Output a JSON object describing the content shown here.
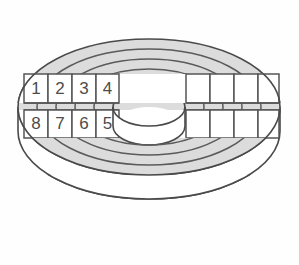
{
  "figure": {
    "kind": "disk-platter-diagram",
    "title": "",
    "background_color": "#fefefe",
    "platter_fill": "#dcdcdc",
    "hole_fill": "#ffffff",
    "line_color": "#4a4a4a",
    "label_color": "#4c4c4c",
    "sector_band_fill": "#ffffff"
  },
  "geometry": {
    "center_x": 149,
    "center_y": 107,
    "edge_offset_y": 62,
    "rings": [
      {
        "name": "platter-outer-edge",
        "rx": 131,
        "ry": 68
      },
      {
        "name": "track-1",
        "rx": 112,
        "ry": 58
      },
      {
        "name": "track-2",
        "rx": 93,
        "ry": 48
      },
      {
        "name": "track-3",
        "rx": 74,
        "ry": 38
      },
      {
        "name": "track-4",
        "rx": 55,
        "ry": 28
      },
      {
        "name": "spindle-hole",
        "rx": 36,
        "ry": 19
      }
    ],
    "bands": [
      {
        "name": "upper-sector-band",
        "y_top": 74,
        "y_bottom": 103
      },
      {
        "name": "lower-sector-band",
        "y_top": 110,
        "y_bottom": 138
      }
    ],
    "left_cell_edges": [
      24,
      48,
      72,
      96,
      119
    ],
    "right_cell_edges": [
      186,
      210,
      234,
      258,
      279
    ]
  },
  "sectors": {
    "upper_row": [
      {
        "id": "sector-1",
        "label": "1",
        "x_center": 36
      },
      {
        "id": "sector-2",
        "label": "2",
        "x_center": 60
      },
      {
        "id": "sector-3",
        "label": "3",
        "x_center": 84
      },
      {
        "id": "sector-4",
        "label": "4",
        "x_center": 107
      }
    ],
    "upper_row_right": [
      {
        "id": "sector-upper-r1",
        "label": "",
        "x_center": 198
      },
      {
        "id": "sector-upper-r2",
        "label": "",
        "x_center": 222
      },
      {
        "id": "sector-upper-r3",
        "label": "",
        "x_center": 246
      },
      {
        "id": "sector-upper-r4",
        "label": "",
        "x_center": 268
      }
    ],
    "lower_row": [
      {
        "id": "sector-8",
        "label": "8",
        "x_center": 36
      },
      {
        "id": "sector-7",
        "label": "7",
        "x_center": 60
      },
      {
        "id": "sector-6",
        "label": "6",
        "x_center": 84
      },
      {
        "id": "sector-5",
        "label": "5",
        "x_center": 107
      }
    ],
    "lower_row_right": [
      {
        "id": "sector-lower-r1",
        "label": "",
        "x_center": 198
      },
      {
        "id": "sector-lower-r2",
        "label": "",
        "x_center": 222
      },
      {
        "id": "sector-lower-r3",
        "label": "",
        "x_center": 246
      },
      {
        "id": "sector-lower-r4",
        "label": "",
        "x_center": 268
      }
    ]
  }
}
